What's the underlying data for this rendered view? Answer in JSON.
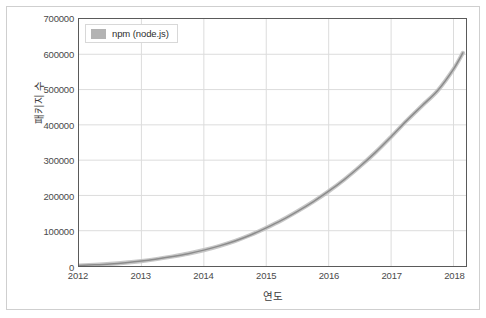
{
  "chart_data": {
    "type": "line",
    "title": "",
    "xlabel": "연도",
    "ylabel": "패키지 수",
    "xlim": [
      2012,
      2018.2
    ],
    "ylim": [
      0,
      700000
    ],
    "grid": true,
    "legend_position": "top-left-inside",
    "series_color": "#8c8c8c",
    "series_halo_color": "#bdbdbd",
    "xticks": [
      2012,
      2013,
      2014,
      2015,
      2016,
      2017,
      2018
    ],
    "xtick_labels": [
      "2012",
      "2013",
      "2014",
      "2015",
      "2016",
      "2017",
      "2018"
    ],
    "yticks": [
      0,
      100000,
      200000,
      300000,
      400000,
      500000,
      600000,
      700000
    ],
    "ytick_labels": [
      "0",
      "100000",
      "200000",
      "300000",
      "400000",
      "500000",
      "600000",
      "700000"
    ],
    "series": [
      {
        "name": "npm (node.js)",
        "x": [
          2012.0,
          2012.25,
          2012.5,
          2012.75,
          2013.0,
          2013.25,
          2013.5,
          2013.75,
          2014.0,
          2014.25,
          2014.5,
          2014.75,
          2015.0,
          2015.25,
          2015.5,
          2015.75,
          2016.0,
          2016.25,
          2016.5,
          2016.75,
          2017.0,
          2017.25,
          2017.5,
          2017.75,
          2018.0,
          2018.15
        ],
        "values": [
          1500,
          3500,
          6000,
          9500,
          14000,
          20000,
          27000,
          35000,
          45000,
          57000,
          71000,
          88000,
          108000,
          130000,
          155000,
          182000,
          212000,
          245000,
          282000,
          322000,
          366000,
          412000,
          455000,
          498000,
          558000,
          604000
        ]
      }
    ]
  },
  "legend": {
    "label": "npm (node.js)",
    "swatch_color": "#b3b3b3"
  },
  "axes": {
    "x_title": "연도",
    "y_title": "패키지 수"
  }
}
